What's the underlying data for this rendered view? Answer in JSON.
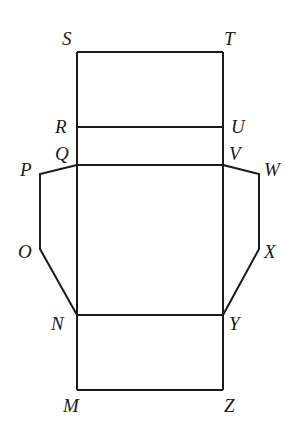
{
  "diagram": {
    "type": "net",
    "stroke_color": "#1a1a1a",
    "background": "#ffffff",
    "points": {
      "S": [
        77,
        52
      ],
      "T": [
        223,
        52
      ],
      "R": [
        77,
        127
      ],
      "U": [
        223,
        127
      ],
      "Q": [
        77,
        165
      ],
      "V": [
        223,
        165
      ],
      "P": [
        40,
        174
      ],
      "W": [
        259,
        174
      ],
      "O": [
        40,
        249
      ],
      "X": [
        259,
        249
      ],
      "N": [
        77,
        315
      ],
      "Y": [
        223,
        315
      ],
      "M": [
        77,
        390
      ],
      "Z": [
        223,
        390
      ]
    },
    "labels": [
      {
        "text": "S",
        "x": 62,
        "y": 45
      },
      {
        "text": "T",
        "x": 224,
        "y": 45
      },
      {
        "text": "R",
        "x": 55,
        "y": 133
      },
      {
        "text": "U",
        "x": 231,
        "y": 133
      },
      {
        "text": "Q",
        "x": 55,
        "y": 160
      },
      {
        "text": "V",
        "x": 229,
        "y": 160
      },
      {
        "text": "P",
        "x": 20,
        "y": 176
      },
      {
        "text": "W",
        "x": 264,
        "y": 176
      },
      {
        "text": "O",
        "x": 18,
        "y": 258
      },
      {
        "text": "X",
        "x": 264,
        "y": 258
      },
      {
        "text": "N",
        "x": 51,
        "y": 330
      },
      {
        "text": "Y",
        "x": 229,
        "y": 330
      },
      {
        "text": "M",
        "x": 63,
        "y": 412
      },
      {
        "text": "Z",
        "x": 224,
        "y": 412
      }
    ]
  }
}
